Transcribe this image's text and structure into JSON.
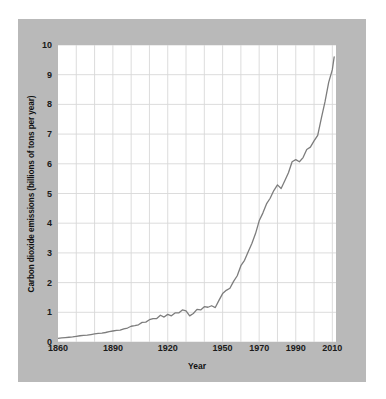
{
  "figure": {
    "background_color": "#ffffff",
    "panel_color": "#b9b9b9",
    "plot_background": "#ffffff",
    "line_color": "#7d7d7d",
    "grid_color": "#d8d8d8",
    "text_color": "#111111"
  },
  "chart_data": {
    "type": "line",
    "title": "",
    "subtitle": "",
    "xlabel": "Year",
    "ylabel": "Carbon dioxide emissions (billions of tons per year)",
    "xlim": [
      1860,
      2012
    ],
    "ylim": [
      0,
      10
    ],
    "xticks": [
      1860,
      1890,
      1920,
      1950,
      1970,
      1990,
      2010
    ],
    "xticklabels": [
      "1860",
      "1890",
      "1920",
      "1950",
      "1970",
      "1990",
      "2010"
    ],
    "yticks": [
      0,
      1,
      2,
      3,
      4,
      5,
      6,
      7,
      8,
      9,
      10
    ],
    "yticklabels": [
      "0",
      "1",
      "2",
      "3",
      "4",
      "5",
      "6",
      "7",
      "8",
      "9",
      "10"
    ],
    "grid": true,
    "grid_x_interval": 10,
    "grid_y_interval": 1,
    "legend": null,
    "series": [
      {
        "name": "Global CO2 emissions",
        "x": [
          1860,
          1862,
          1864,
          1866,
          1868,
          1870,
          1872,
          1874,
          1876,
          1878,
          1880,
          1882,
          1884,
          1886,
          1888,
          1890,
          1892,
          1894,
          1896,
          1898,
          1900,
          1902,
          1904,
          1906,
          1908,
          1910,
          1912,
          1914,
          1916,
          1918,
          1920,
          1922,
          1924,
          1926,
          1928,
          1930,
          1932,
          1934,
          1936,
          1938,
          1940,
          1942,
          1944,
          1946,
          1948,
          1950,
          1952,
          1954,
          1956,
          1958,
          1960,
          1962,
          1964,
          1966,
          1968,
          1970,
          1972,
          1974,
          1976,
          1978,
          1980,
          1982,
          1984,
          1986,
          1988,
          1990,
          1992,
          1994,
          1996,
          1998,
          2000,
          2002,
          2004,
          2006,
          2008,
          2010,
          2011
        ],
        "y": [
          0.12,
          0.14,
          0.15,
          0.16,
          0.17,
          0.19,
          0.21,
          0.22,
          0.23,
          0.25,
          0.27,
          0.29,
          0.3,
          0.32,
          0.35,
          0.37,
          0.39,
          0.4,
          0.44,
          0.47,
          0.53,
          0.55,
          0.58,
          0.66,
          0.67,
          0.75,
          0.79,
          0.79,
          0.9,
          0.84,
          0.93,
          0.88,
          0.98,
          0.98,
          1.08,
          1.05,
          0.88,
          0.96,
          1.1,
          1.08,
          1.19,
          1.17,
          1.22,
          1.16,
          1.4,
          1.63,
          1.74,
          1.81,
          2.04,
          2.23,
          2.57,
          2.75,
          3.04,
          3.32,
          3.65,
          4.08,
          4.34,
          4.65,
          4.84,
          5.1,
          5.29,
          5.17,
          5.43,
          5.7,
          6.07,
          6.14,
          6.07,
          6.21,
          6.48,
          6.56,
          6.77,
          6.96,
          7.54,
          8.09,
          8.74,
          9.17,
          9.6
        ]
      }
    ],
    "annotations": []
  },
  "axis_title_y": "Carbon dioxide emissions (billions of tons per year)",
  "axis_title_x": "Year"
}
